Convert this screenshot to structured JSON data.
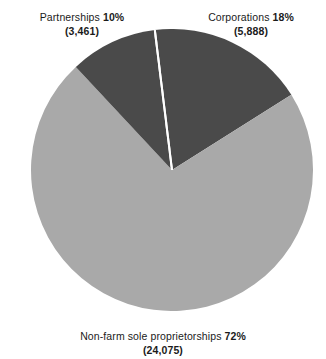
{
  "chart_data": {
    "type": "pie",
    "title": "",
    "subtitle": "",
    "xlabel": "",
    "ylabel": "",
    "legend_position": "none",
    "grid": false,
    "unit_note": "",
    "categories": [
      "Corporations",
      "Non-farm sole proprietorships",
      "Partnerships"
    ],
    "values": [
      5888,
      24075,
      3461
    ],
    "percentages": [
      18,
      72,
      10
    ],
    "slices": [
      {
        "name": "Corporations",
        "percent": 18,
        "percent_text": "18%",
        "value": 5888,
        "value_text": "(5,888)",
        "color": "#4a4a4a",
        "start_angle": -7,
        "end_angle": 57.8
      },
      {
        "name": "Non-farm sole proprietorships",
        "percent": 72,
        "percent_text": "72%",
        "value": 24075,
        "value_text": "(24,075)",
        "color": "#a9a9a9",
        "start_angle": 57.8,
        "end_angle": 317
      },
      {
        "name": "Partnerships",
        "percent": 10,
        "percent_text": "10%",
        "value": 3461,
        "value_text": "(3,461)",
        "color": "#4a4a4a",
        "start_angle": 317,
        "end_angle": 353
      }
    ]
  },
  "labels": {
    "partnerships": {
      "name": "Partnerships ",
      "percent": "10%",
      "count": "(3,461)"
    },
    "corporations": {
      "name": "Corporations ",
      "percent": "18%",
      "count": "(5,888)"
    },
    "nonfarm": {
      "name": "Non-farm sole proprietorships ",
      "percent": "72%",
      "count": "(24,075)"
    }
  },
  "colors": {
    "background": "#ffffff",
    "dark_slice": "#4a4a4a",
    "light_slice": "#a9a9a9",
    "separator": "#ffffff",
    "text": "#1b1b1b"
  }
}
